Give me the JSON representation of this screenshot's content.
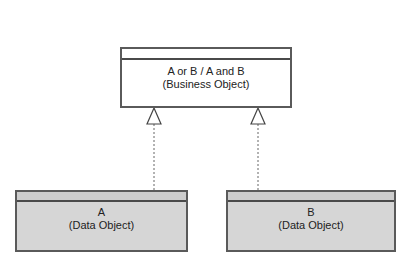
{
  "colors": {
    "business_fill": "#ffffff",
    "data_fill": "#d4d4d4",
    "data_header_fill": "#cccccc",
    "border": "#5a5a5a",
    "connector": "#666666"
  },
  "business_object": {
    "title": "A or B / A and B",
    "subtitle": "(Business Object)"
  },
  "data_objects": [
    {
      "title": "A",
      "subtitle": "(Data Object)"
    },
    {
      "title": "B",
      "subtitle": "(Data Object)"
    }
  ],
  "relations": [
    {
      "from": "A",
      "to": "A or B / A and B",
      "type": "realization"
    },
    {
      "from": "B",
      "to": "A or B / A and B",
      "type": "realization"
    }
  ]
}
